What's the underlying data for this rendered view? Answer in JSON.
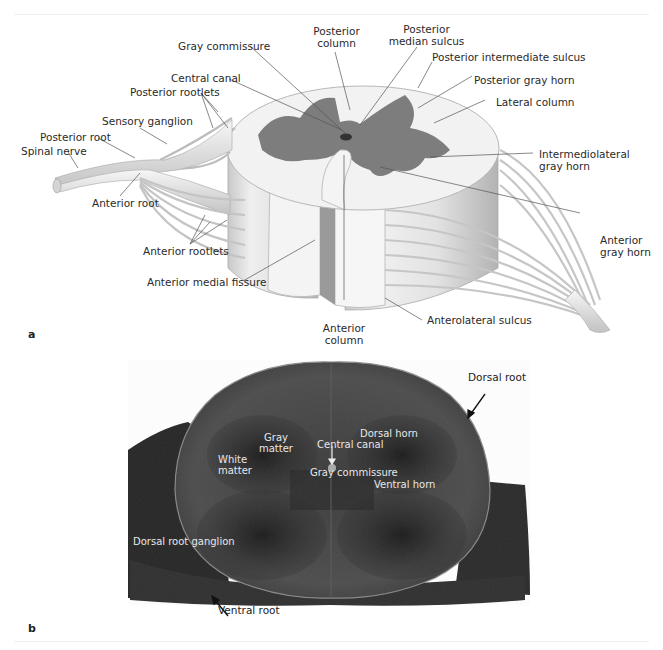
{
  "figure": {
    "panel_a": {
      "id": "a",
      "title": "Spinal cord segment (illustration)",
      "labels": {
        "gray_commissure": "Gray commissure",
        "posterior_column": "Posterior\ncolumn",
        "posterior_column_l1": "Posterior",
        "posterior_column_l2": "column",
        "posterior_median_sulcus_l1": "Posterior",
        "posterior_median_sulcus_l2": "median sulcus",
        "posterior_intermediate_sulcus": "Posterior intermediate sulcus",
        "central_canal": "Central canal",
        "posterior_gray_horn": "Posterior gray horn",
        "posterior_rootlets": "Posterior rootlets",
        "lateral_column": "Lateral column",
        "sensory_ganglion": "Sensory ganglion",
        "posterior_root": "Posterior root",
        "spinal_nerve": "Spinal nerve",
        "intermediolateral_l1": "Intermediolateral",
        "intermediolateral_l2": "gray horn",
        "anterior_root": "Anterior root",
        "anterior_rootlets": "Anterior rootlets",
        "anterior_gray_horn_l1": "Anterior",
        "anterior_gray_horn_l2": "gray horn",
        "anterior_medial_fissure": "Anterior medial fissure",
        "anterior_column_l1": "Anterior",
        "anterior_column_l2": "column",
        "anterolateral_sulcus": "Anterolateral sulcus"
      }
    },
    "panel_b": {
      "id": "b",
      "title": "Spinal cord cross-section (micrograph)",
      "labels": {
        "dorsal_root": "Dorsal root",
        "gray_matter_l1": "Gray",
        "gray_matter_l2": "matter",
        "dorsal_horn": "Dorsal horn",
        "central_canal": "Central canal",
        "white_matter_l1": "White",
        "white_matter_l2": "matter",
        "gray_commissure": "Gray commissure",
        "ventral_horn": "Ventral horn",
        "dorsal_root_ganglion": "Dorsal root ganglion",
        "ventral_root": "Ventral root"
      }
    },
    "colors": {
      "gray_matter_illustration": "#7d7d7d",
      "white_matter_illustration": "#f2f2f2",
      "micrograph_dark": "#2b2b2b",
      "micrograph_mid": "#4a4a4a",
      "label_text": "#2a2a2a"
    }
  }
}
